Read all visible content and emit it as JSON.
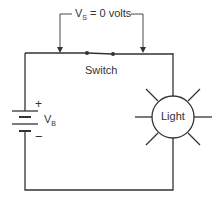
{
  "diagram": {
    "type": "circuit",
    "components": {
      "battery": {
        "label": "V",
        "subscript": "B",
        "positive": "+",
        "negative": "−"
      },
      "switch": {
        "label": "Switch",
        "state": "closed"
      },
      "lamp": {
        "label": "Light"
      }
    },
    "annotation": {
      "prefix": "V",
      "subscript": "S",
      "suffix": " = 0 volts"
    },
    "colors": {
      "stroke": "#333333",
      "background": "#ffffff"
    }
  }
}
